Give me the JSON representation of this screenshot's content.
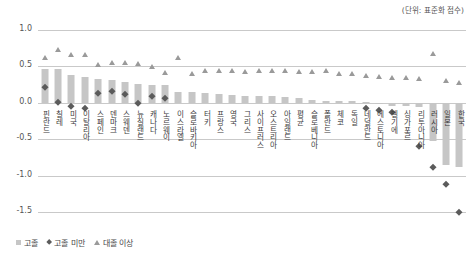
{
  "unit_note": "(단위: 표준화 점수)",
  "legend": {
    "items": [
      {
        "label": "고졸",
        "marker": "square",
        "color": "#c6c6c6"
      },
      {
        "label": "고졸 미만",
        "marker": "diamond",
        "color": "#5b5b5b"
      },
      {
        "label": "대졸 이상",
        "marker": "triangle",
        "color": "#9a9a9a"
      }
    ]
  },
  "chart_data": {
    "type": "bar",
    "title": "",
    "subtitle": "",
    "xlabel": "",
    "ylabel": "",
    "ylim": [
      -1.5,
      1.0
    ],
    "yticks": [
      "1.0",
      "0.5",
      "0.0",
      "-0.5",
      "-1.0",
      "-1.5"
    ],
    "ytick_values": [
      1.0,
      0.5,
      0.0,
      -0.5,
      -1.0,
      -1.5
    ],
    "grid": true,
    "legend_position": "bottom-left",
    "categories": [
      "핀란드",
      "칠레",
      "미국",
      "이탈리아",
      "스페인",
      "덴마크",
      "스웨덴",
      "뉴질랜드",
      "캐나다",
      "노르웨이",
      "이스라엘",
      "슬로바키아",
      "터키",
      "프랑스",
      "영국",
      "그리스",
      "사이프러스",
      "오스트리아",
      "아일랜드",
      "평균",
      "슬로베니아",
      "폴란드",
      "체코",
      "독일",
      "네덜란드",
      "에스토니아",
      "벨기에",
      "싱가포르",
      "리투아니아",
      "러시아",
      "일본",
      "한국"
    ],
    "series": [
      {
        "name": "고졸",
        "marker": "square-bar",
        "color": "#c6c6c6",
        "values": [
          0.46,
          0.46,
          0.38,
          0.35,
          0.33,
          0.31,
          0.29,
          0.26,
          0.25,
          0.24,
          0.15,
          0.15,
          0.13,
          0.12,
          0.11,
          0.1,
          0.09,
          0.09,
          0.08,
          0.06,
          0.04,
          0.03,
          0.02,
          0.02,
          0.01,
          -0.02,
          -0.04,
          -0.05,
          -0.06,
          -0.52,
          -0.86,
          -0.88
        ]
      },
      {
        "name": "고졸 미만",
        "marker": "diamond",
        "color": "#5b5b5b",
        "values": [
          0.22,
          0.01,
          -0.05,
          -0.07,
          0.13,
          0.16,
          0.12,
          0.0,
          0.09,
          0.07,
          null,
          null,
          null,
          null,
          null,
          null,
          null,
          null,
          null,
          null,
          null,
          null,
          null,
          null,
          -0.07,
          -0.1,
          -0.13,
          null,
          -0.6,
          -0.88,
          -1.12,
          -1.5
        ]
      },
      {
        "name": "대졸 이상",
        "marker": "triangle",
        "color": "#9a9a9a",
        "values": [
          0.62,
          0.73,
          0.65,
          0.65,
          0.52,
          0.54,
          0.54,
          0.53,
          0.49,
          0.41,
          0.62,
          0.4,
          0.44,
          0.44,
          0.43,
          0.42,
          0.44,
          0.43,
          0.43,
          0.42,
          0.42,
          0.44,
          0.4,
          0.39,
          0.37,
          0.35,
          0.34,
          0.34,
          0.33,
          0.67,
          0.3,
          0.27
        ]
      }
    ]
  }
}
